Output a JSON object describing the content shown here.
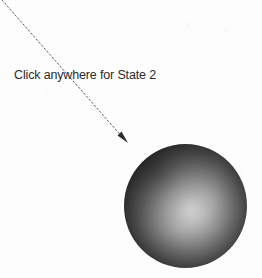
{
  "figure": {
    "background_color": "#fdfdfd",
    "width": 262,
    "height": 278
  },
  "annotation": {
    "label": "Click anywhere for State 2",
    "text_color": "#2b2b2b",
    "arrow": {
      "icon_name": "dashed-arrow",
      "color": "#5a5a5a",
      "dash_pattern": "1.6 2.4",
      "start_x": 2,
      "start_y": 0,
      "end_x": 128,
      "end_y": 143
    }
  },
  "sphere": {
    "icon_name": "shaded-sphere",
    "center_x": 185,
    "center_y": 206,
    "diameter": 123,
    "highlight_color": "#d8d8d8",
    "edge_color": "#0d0d0d",
    "highlight_offset_x": "53%",
    "highlight_offset_y": "52%"
  }
}
